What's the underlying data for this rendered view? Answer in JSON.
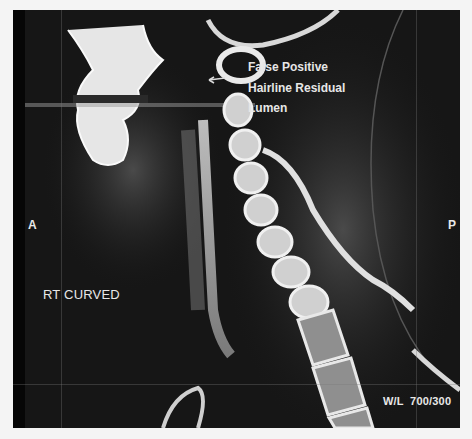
{
  "image": {
    "description": "Curved reformatted CT angiography of the neck, lateral view showing cervical spine and carotid artery",
    "orientation_left": "A",
    "orientation_right": "P",
    "reformat_label": "RT CURVED",
    "window_level": "W/L  700/300",
    "annotation": {
      "lines": [
        "False Positive",
        "Hairline Residual",
        "Lumen"
      ],
      "arrow_icon": "left-arrow"
    }
  }
}
